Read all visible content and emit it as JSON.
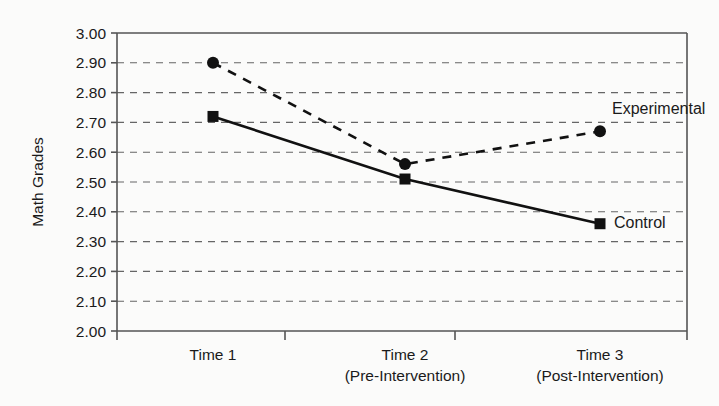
{
  "chart_data": {
    "type": "line",
    "title": "",
    "xlabel": "",
    "ylabel": "Math Grades",
    "categories": [
      "Time 1",
      "Time 2",
      "Time 3"
    ],
    "category_sublabels": [
      "",
      "(Pre-Intervention)",
      "(Post-Intervention)"
    ],
    "ylim": [
      2.0,
      3.0
    ],
    "ytick_step": 0.1,
    "ytick_labels": [
      "3.00",
      "2.90",
      "2.80",
      "2.70",
      "2.60",
      "2.50",
      "2.40",
      "2.30",
      "2.20",
      "2.10",
      "2.00"
    ],
    "ytick_values": [
      3.0,
      2.9,
      2.8,
      2.7,
      2.6,
      2.5,
      2.4,
      2.3,
      2.2,
      2.1,
      2.0
    ],
    "grid": true,
    "grid_style": "dashed-horizontal",
    "legend": "inline-annotations",
    "series": [
      {
        "name": "Experimental",
        "values": [
          2.9,
          2.56,
          2.67
        ],
        "line_style": "dashed",
        "marker": "circle",
        "color": "#111111"
      },
      {
        "name": "Control",
        "values": [
          2.72,
          2.51,
          2.36
        ],
        "line_style": "solid",
        "marker": "square",
        "color": "#111111"
      }
    ],
    "annotations": [
      {
        "text": "Experimental",
        "series": "Experimental"
      },
      {
        "text": "Control",
        "series": "Control"
      }
    ]
  },
  "colors": {
    "background": "#fbfbfa",
    "ink": "#1a1a1a",
    "axis": "#555555",
    "grid": "#666666"
  }
}
